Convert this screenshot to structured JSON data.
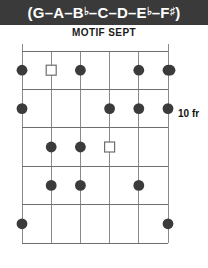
{
  "header": {
    "title_full": "(G–A–B♭–C–D–E♭–F♯)",
    "open_paren": "(",
    "close_paren": ")",
    "dash": "–",
    "notes": [
      {
        "letter": "G",
        "accidental": ""
      },
      {
        "letter": "A",
        "accidental": ""
      },
      {
        "letter": "B",
        "accidental": "♭"
      },
      {
        "letter": "C",
        "accidental": ""
      },
      {
        "letter": "D",
        "accidental": ""
      },
      {
        "letter": "E",
        "accidental": "♭"
      },
      {
        "letter": "F",
        "accidental": "♯"
      }
    ],
    "background_color": "#3a3a3a",
    "text_color": "#ffffff"
  },
  "subtitle": {
    "text": "MOTIF SEPT"
  },
  "diagram": {
    "type": "guitar-fretboard",
    "strings": 6,
    "frets": 5,
    "position_label": "10 fr",
    "line_color": "#8a8a8a",
    "dot_color": "#3b3b3b",
    "open_marker_color": "#ffffff",
    "markers": [
      {
        "string": 1,
        "fret": 1,
        "kind": "filled"
      },
      {
        "string": 2,
        "fret": 1,
        "kind": "open-square"
      },
      {
        "string": 3,
        "fret": 1,
        "kind": "filled"
      },
      {
        "string": 5,
        "fret": 1,
        "kind": "filled"
      },
      {
        "string": 6,
        "fret": 1,
        "kind": "filled"
      },
      {
        "string": 1,
        "fret": 2,
        "kind": "filled"
      },
      {
        "string": 4,
        "fret": 2,
        "kind": "filled"
      },
      {
        "string": 5,
        "fret": 2,
        "kind": "filled"
      },
      {
        "string": 6,
        "fret": 2,
        "kind": "filled"
      },
      {
        "string": 2,
        "fret": 3,
        "kind": "filled"
      },
      {
        "string": 3,
        "fret": 3,
        "kind": "filled"
      },
      {
        "string": 4,
        "fret": 3,
        "kind": "open-square"
      },
      {
        "string": 2,
        "fret": 4,
        "kind": "filled"
      },
      {
        "string": 3,
        "fret": 4,
        "kind": "filled"
      },
      {
        "string": 5,
        "fret": 4,
        "kind": "filled"
      },
      {
        "string": 1,
        "fret": 5,
        "kind": "filled"
      },
      {
        "string": 6,
        "fret": 5,
        "kind": "filled"
      }
    ]
  }
}
